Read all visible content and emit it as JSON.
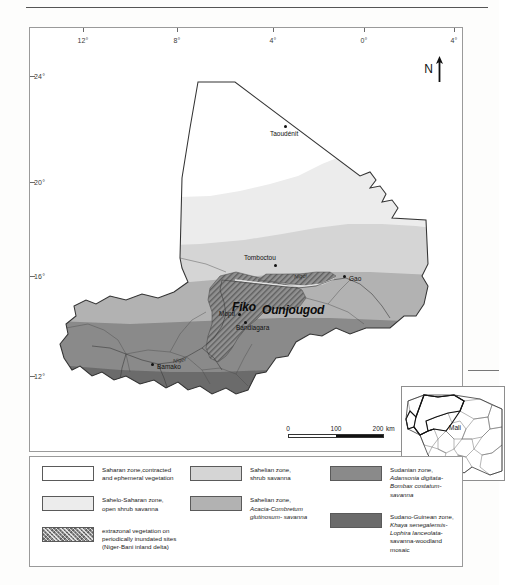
{
  "figure": {
    "type": "thematic-map",
    "region": "Mali",
    "title_visible": false
  },
  "map": {
    "graticule": {
      "longitude_labels": [
        "12°",
        "8°",
        "4°",
        "0°",
        "4°"
      ],
      "latitude_labels": [
        "24°",
        "20°",
        "16°",
        "12°"
      ]
    },
    "north_arrow_label": "N",
    "cities": [
      {
        "name": "Taoudénit",
        "label_pos": "below"
      },
      {
        "name": "Tomboctou",
        "label_pos": "left"
      },
      {
        "name": "Gao",
        "label_pos": "right"
      },
      {
        "name": "Mopti",
        "label_pos": "left"
      },
      {
        "name": "Bandiagara",
        "label_pos": "below"
      },
      {
        "name": "Bamako",
        "label_pos": "right"
      }
    ],
    "site_labels": [
      "Fiko",
      "Ounjougod"
    ],
    "river_labels": [
      "Niger",
      "Niger"
    ],
    "scale_bar": {
      "values": [
        "0",
        "100",
        "200"
      ],
      "unit": "km"
    }
  },
  "inset": {
    "country_label": "Mali"
  },
  "legend": {
    "columns": [
      {
        "items": [
          {
            "swatch": "#ffffff",
            "style": "solid",
            "lines": [
              {
                "text": "Saharan zone,contracted",
                "italic": false
              },
              {
                "text": "and ephemeral vegetation",
                "italic": false
              }
            ]
          },
          {
            "swatch": "#ececec",
            "style": "solid",
            "lines": [
              {
                "text": "Sahelo-Saharan zone,",
                "italic": false
              },
              {
                "text": "open shrub savanna",
                "italic": false
              }
            ]
          },
          {
            "swatch": "#8e8e8e",
            "style": "hatch",
            "lines": [
              {
                "text": "extrazonal vegetation on",
                "italic": false
              },
              {
                "text": "periodically inundated sites",
                "italic": false
              },
              {
                "text": "(Niger-Bani inland delta)",
                "italic": false
              }
            ]
          }
        ]
      },
      {
        "items": [
          {
            "swatch": "#d5d5d5",
            "style": "solid",
            "lines": [
              {
                "text": "Sahelian zone,",
                "italic": false
              },
              {
                "text": "shrub savanna",
                "italic": false
              }
            ]
          },
          {
            "swatch": "#b2b2b2",
            "style": "solid",
            "lines": [
              {
                "text": "Sahelian zone,",
                "italic": false
              },
              {
                "text": "Acacia-Combretum",
                "italic": true
              },
              {
                "text": "glutinosum- savanna",
                "italic": true
              }
            ]
          }
        ]
      },
      {
        "items": [
          {
            "swatch": "#8a8a8a",
            "style": "solid",
            "lines": [
              {
                "text": "Sudanian zone,",
                "italic": false
              },
              {
                "text": "Adansonia digitata-",
                "italic": true
              },
              {
                "text": "Bombax costatum-savanna",
                "italic": true
              }
            ]
          },
          {
            "swatch": "#6b6b6b",
            "style": "solid",
            "lines": [
              {
                "text": "Sudano-Guinean zone,",
                "italic": false
              },
              {
                "text": "Khaya senegalensis-",
                "italic": true
              },
              {
                "text": "Lophira lanceolata-",
                "italic": true
              },
              {
                "text": "savanna-woodland mosaic",
                "italic": false
              }
            ]
          }
        ]
      }
    ]
  },
  "colors": {
    "saharan": "#ffffff",
    "sahelo_saharan": "#ececec",
    "sahelian_shrub": "#d5d5d5",
    "sahelian_acacia": "#b2b2b2",
    "sudanian": "#8a8a8a",
    "sudano_guinean": "#6b6b6b",
    "inland_delta": "#8e8e8e",
    "outline": "#333333",
    "frame": "#9a9a9a"
  }
}
